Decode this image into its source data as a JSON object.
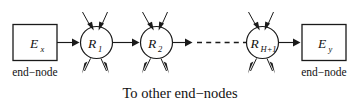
{
  "figure": {
    "background_color": "#ffffff",
    "stroke_color": "#1a1a1a",
    "text_color": "#111111",
    "width": 358,
    "height": 104
  },
  "end_nodes": [
    {
      "id": "end-node-left",
      "symbol": "E",
      "subscript": "x",
      "caption": "end−node"
    },
    {
      "id": "end-node-right",
      "symbol": "E",
      "subscript": "y",
      "caption": "end−node"
    }
  ],
  "routers": [
    {
      "id": "router-1",
      "symbol": "R",
      "subscript": "1",
      "in_arrows": 2,
      "out_arrows": 2
    },
    {
      "id": "router-2",
      "symbol": "R",
      "subscript": "2",
      "in_arrows": 2,
      "out_arrows": 2
    },
    {
      "id": "router-h1",
      "symbol": "R",
      "subscript": "H+1",
      "in_arrows": 2,
      "out_arrows": 2
    }
  ],
  "ellipsis": {
    "id": "dashed-continuation",
    "style": "dashed",
    "dash_count": 6
  },
  "captions": {
    "bottom": "To other end−nodes"
  },
  "links": [
    {
      "from": "end-node-left",
      "to": "router-1",
      "arrow": true
    },
    {
      "from": "router-1",
      "to": "router-2",
      "arrow": true
    },
    {
      "from": "router-2",
      "to": "dashed-continuation",
      "arrow": true
    },
    {
      "from": "dashed-continuation",
      "to": "router-h1",
      "arrow": false
    },
    {
      "from": "router-h1",
      "to": "end-node-right",
      "arrow": true
    }
  ]
}
